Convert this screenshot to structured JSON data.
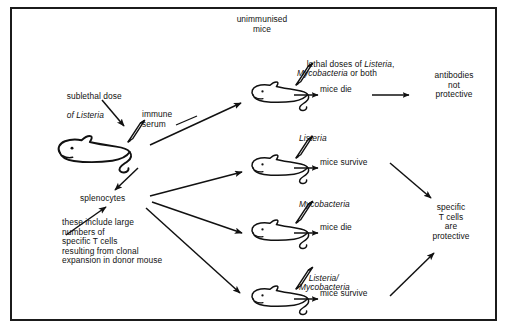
{
  "figure": {
    "title": "unimmunised\nmice",
    "border_color": "#1b1b1b",
    "background": "#ffffff",
    "ink_color": "#111111"
  },
  "donor": {
    "injection_label": "sublethal dose\nof Listeria",
    "injection_label_plain": "sublethal dose",
    "injection_label_italic": "of Listeria",
    "serum_label": "immune\nserum",
    "splenocytes_label": "splenocytes",
    "splenocytes_note": "these include large\nnumbers of\nspecific T cells\nresulting from clonal\nexpansion in donor mouse"
  },
  "branches": [
    {
      "id": "serum-recipient",
      "challenge_plain": "lethal doses of ",
      "challenge_italic_1": "Listeria",
      "challenge_mid": ",",
      "challenge_italic_2": "Mycobacteria",
      "challenge_tail": " or both",
      "challenge_full": "lethal doses of Listeria, Mycobacteria or both",
      "outcome": "mice die"
    },
    {
      "id": "splenocyte-listeria",
      "challenge_italic_1": "Listeria",
      "challenge_full": "Listeria",
      "outcome": "mice survive"
    },
    {
      "id": "splenocyte-mycobacteria",
      "challenge_italic_1": "Mycobacteria",
      "challenge_full": "Mycobacteria",
      "outcome": "mice die"
    },
    {
      "id": "splenocyte-both",
      "challenge_italic_1": "Listeria/",
      "challenge_italic_2": "Mycobacteria",
      "challenge_full": "Listeria/Mycobacteria",
      "outcome": "mice survive"
    }
  ],
  "conclusions": {
    "antibodies": "antibodies\nnot\nprotective",
    "tcells": "specific\nT cells\nare\nprotective"
  }
}
